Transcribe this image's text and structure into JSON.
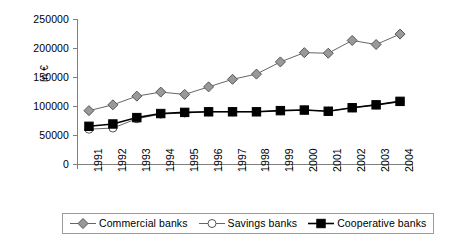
{
  "chart_data": {
    "type": "line",
    "title": "",
    "xlabel": "",
    "ylabel": "in €",
    "categories": [
      "1991",
      "1992",
      "1993",
      "1994",
      "1995",
      "1996",
      "1997",
      "1998",
      "1999",
      "2000",
      "2001",
      "2002",
      "2003",
      "2004"
    ],
    "ylim": [
      0,
      250000
    ],
    "y_ticks": [
      "0",
      "50000",
      "100000",
      "150000",
      "200000",
      "250000"
    ],
    "y_tick_values": [
      0,
      50000,
      100000,
      150000,
      200000,
      250000
    ],
    "grid": false,
    "legend_position": "bottom",
    "series": [
      {
        "name": "Commercial banks",
        "marker": "diamond",
        "color": "#999999",
        "line_color": "#666666",
        "values": [
          92000,
          102000,
          117000,
          124000,
          120000,
          133000,
          146000,
          155000,
          176000,
          192000,
          191000,
          213000,
          206000,
          224000
        ]
      },
      {
        "name": "Savings banks",
        "marker": "circle",
        "color": "#ffffff",
        "line_color": "#666666",
        "values": [
          60000,
          62000,
          78000,
          86000,
          88000,
          90000,
          90000,
          90000,
          92000,
          93000,
          91000,
          97000,
          102000,
          108000
        ]
      },
      {
        "name": "Cooperative banks",
        "marker": "square",
        "color": "#000000",
        "line_color": "#000000",
        "values": [
          65000,
          69000,
          80000,
          87000,
          89000,
          90000,
          90000,
          90000,
          92000,
          93000,
          91000,
          97000,
          102000,
          108000
        ]
      }
    ]
  },
  "legend": {
    "entries": [
      {
        "label": "Commercial banks"
      },
      {
        "label": "Savings banks"
      },
      {
        "label": "Cooperative banks"
      }
    ]
  }
}
